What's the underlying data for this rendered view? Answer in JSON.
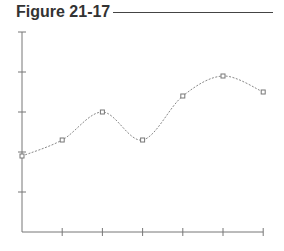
{
  "header": {
    "title": "Figure 21-17"
  },
  "chart_data": {
    "type": "line",
    "title": "Figure 21-17",
    "xlabel": "",
    "ylabel": "",
    "categories": [
      "1",
      "2",
      "3",
      "4",
      "5",
      "6",
      "7"
    ],
    "x": [
      0,
      1,
      2,
      3,
      4,
      5,
      6
    ],
    "series": [
      {
        "name": "series",
        "values": [
          1.9,
          2.3,
          3.0,
          2.3,
          3.4,
          3.9,
          3.5
        ],
        "style": "dashed smooth curve with square markers"
      }
    ],
    "ylim": [
      0,
      5
    ],
    "xlim": [
      0,
      6
    ],
    "y_ticks": [
      1,
      2,
      3,
      4,
      5
    ],
    "x_ticks": [
      1,
      2,
      3,
      4,
      5,
      6
    ],
    "tick_labels_shown": false,
    "grid": false,
    "legend": "none"
  },
  "colors": {
    "axis": "#777777",
    "line": "#888888",
    "marker": "#777777",
    "title": "#333333"
  }
}
